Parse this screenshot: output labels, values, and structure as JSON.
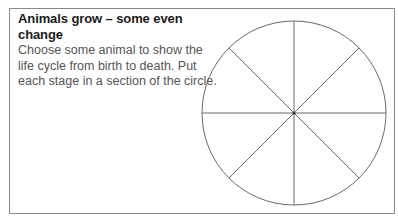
{
  "worksheet": {
    "title": "Animals grow – some even change",
    "instructions_lines": [
      "Choose some animal to show the",
      "life cycle from birth to death. Put",
      "each stage in a section of the circle."
    ]
  },
  "diagram": {
    "type": "life-cycle-circle",
    "sections": 8,
    "center": [
      294,
      113
    ],
    "radius": 92,
    "line_color": "#6a6a6a"
  }
}
